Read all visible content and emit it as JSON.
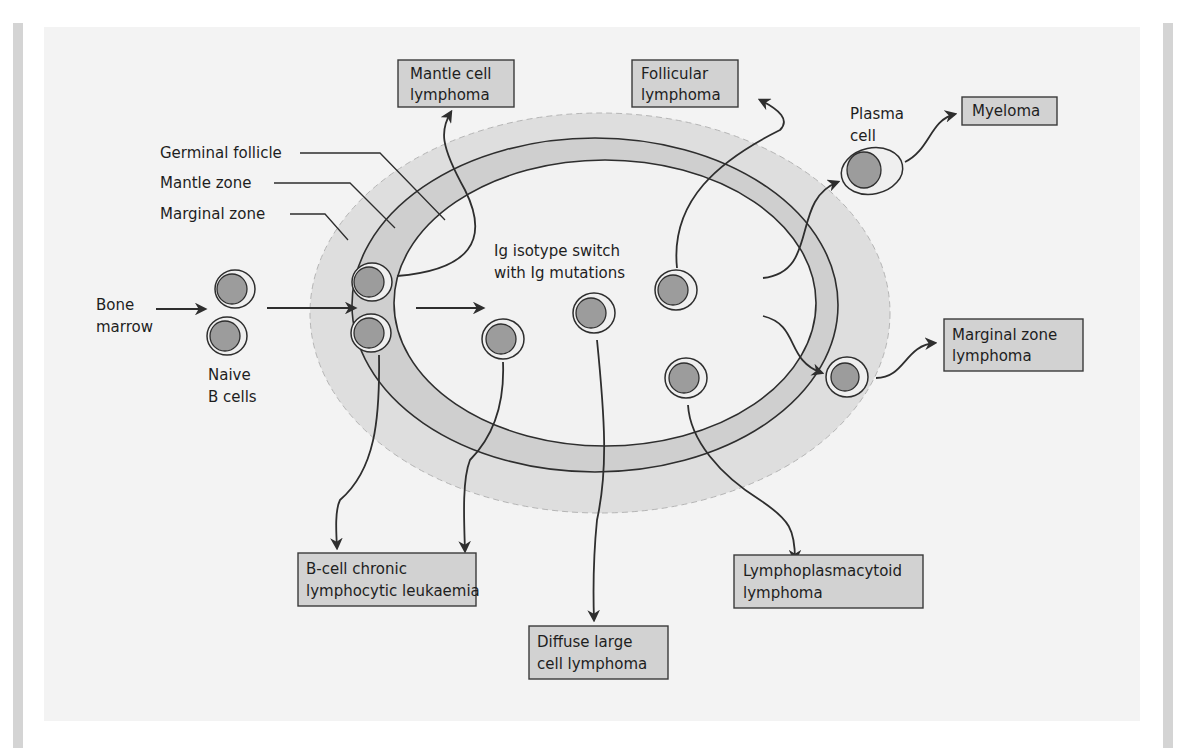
{
  "figure": {
    "type": "B-cell lymphoma origins diagram",
    "colors": {
      "panel_background": "#f3f3f3",
      "marginal_zone_fill": "#dedede",
      "mantle_zone_fill": "#cfcfcf",
      "germinal_follicle_fill": "#f2f2f2",
      "box_fill": "#d2d2d2",
      "nucleus_fill": "#9c9c9c",
      "line_color": "#2e2e2e"
    }
  },
  "zone_labels": {
    "germinal_follicle": "Germinal follicle",
    "mantle_zone": "Mantle zone",
    "marginal_zone": "Marginal zone"
  },
  "source_labels": {
    "bone_marrow_line1": "Bone",
    "bone_marrow_line2": "marrow",
    "naive_line1": "Naive",
    "naive_line2": "B cells",
    "plasma_line1": "Plasma",
    "plasma_line2": "cell",
    "isotype_line1": "Ig isotype switch",
    "isotype_line2": "with Ig mutations"
  },
  "lymphoma_boxes": {
    "mantle_cell": {
      "line1": "Mantle cell",
      "line2": "lymphoma"
    },
    "follicular": {
      "line1": "Follicular",
      "line2": "lymphoma"
    },
    "myeloma": {
      "line1": "Myeloma"
    },
    "marginal_zone": {
      "line1": "Marginal zone",
      "line2": "lymphoma"
    },
    "b_cell_cll": {
      "line1": "B-cell chronic",
      "line2": "lymphocytic leukaemia"
    },
    "diffuse_large": {
      "line1": "Diffuse large",
      "line2": "cell lymphoma"
    },
    "lymphoplasmacytoid": {
      "line1": "Lymphoplasmacytoid",
      "line2": "lymphoma"
    }
  }
}
